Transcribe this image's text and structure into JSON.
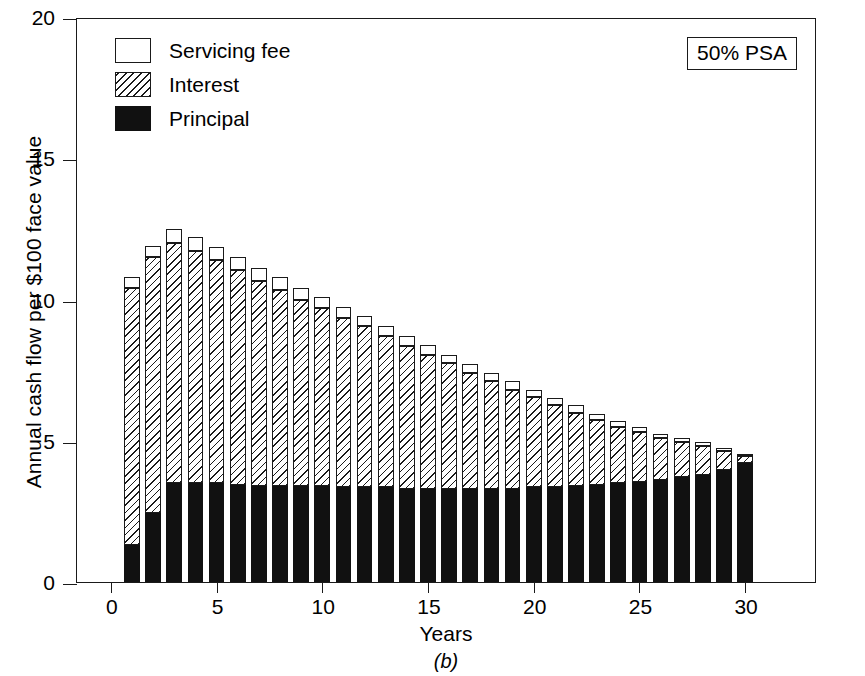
{
  "figure": {
    "panel_caption": "(b)",
    "annotation": "50% PSA"
  },
  "legend": {
    "position": "top-left-inside",
    "items": [
      {
        "label": "Servicing fee",
        "swatch": "white-open-square"
      },
      {
        "label": "Interest",
        "swatch": "hatched-square"
      },
      {
        "label": "Principal",
        "swatch": "solid-black-square"
      }
    ]
  },
  "chart_data": {
    "type": "bar",
    "stacked": true,
    "title": "",
    "subtitle": "",
    "annotation": "50% PSA",
    "panel": "(b)",
    "xlabel": "Years",
    "ylabel": "Annual cash flow per $100 face value",
    "xlim": [
      -1.6,
      33.4
    ],
    "ylim": [
      0,
      20
    ],
    "xticks": [
      0,
      5,
      10,
      15,
      20,
      25,
      30
    ],
    "xtick_labels": [
      "0",
      "5",
      "10",
      "15",
      "20",
      "25",
      "30"
    ],
    "yticks": [
      0,
      5,
      10,
      15,
      20
    ],
    "ytick_labels": [
      "0",
      "5",
      "10",
      "15",
      "20"
    ],
    "grid": false,
    "legend_entries": [
      "Servicing fee",
      "Interest",
      "Principal"
    ],
    "categories": [
      1,
      2,
      3,
      4,
      5,
      6,
      7,
      8,
      9,
      10,
      11,
      12,
      13,
      14,
      15,
      16,
      17,
      18,
      19,
      20,
      21,
      22,
      23,
      24,
      25,
      26,
      27,
      28,
      29,
      30
    ],
    "series": [
      {
        "name": "Principal",
        "color": "#111111",
        "values": [
          1.3,
          2.45,
          3.5,
          3.5,
          3.5,
          3.45,
          3.4,
          3.4,
          3.4,
          3.4,
          3.35,
          3.35,
          3.35,
          3.3,
          3.3,
          3.3,
          3.3,
          3.3,
          3.3,
          3.35,
          3.35,
          3.4,
          3.45,
          3.5,
          3.55,
          3.6,
          3.7,
          3.8,
          3.95,
          4.2
        ]
      },
      {
        "name": "Interest",
        "color": "hatch",
        "values": [
          9.1,
          9.05,
          8.5,
          8.2,
          7.9,
          7.6,
          7.25,
          6.95,
          6.6,
          6.3,
          6.0,
          5.7,
          5.35,
          5.05,
          4.75,
          4.45,
          4.1,
          3.8,
          3.5,
          3.2,
          2.9,
          2.6,
          2.3,
          2.0,
          1.75,
          1.5,
          1.25,
          1.0,
          0.7,
          0.25
        ]
      },
      {
        "name": "Servicing fee",
        "color": "#ffffff",
        "values": [
          0.4,
          0.4,
          0.5,
          0.5,
          0.45,
          0.45,
          0.45,
          0.45,
          0.4,
          0.4,
          0.4,
          0.35,
          0.35,
          0.35,
          0.35,
          0.3,
          0.3,
          0.3,
          0.3,
          0.25,
          0.25,
          0.25,
          0.2,
          0.2,
          0.2,
          0.15,
          0.15,
          0.15,
          0.1,
          0.05
        ]
      }
    ],
    "totals": [
      10.8,
      11.9,
      12.5,
      12.2,
      11.85,
      11.5,
      11.1,
      10.8,
      10.4,
      10.1,
      9.75,
      9.4,
      9.05,
      8.7,
      8.4,
      8.05,
      7.7,
      7.4,
      7.1,
      6.8,
      6.5,
      6.25,
      5.95,
      5.7,
      5.5,
      5.25,
      5.1,
      4.95,
      4.75,
      4.5
    ]
  }
}
